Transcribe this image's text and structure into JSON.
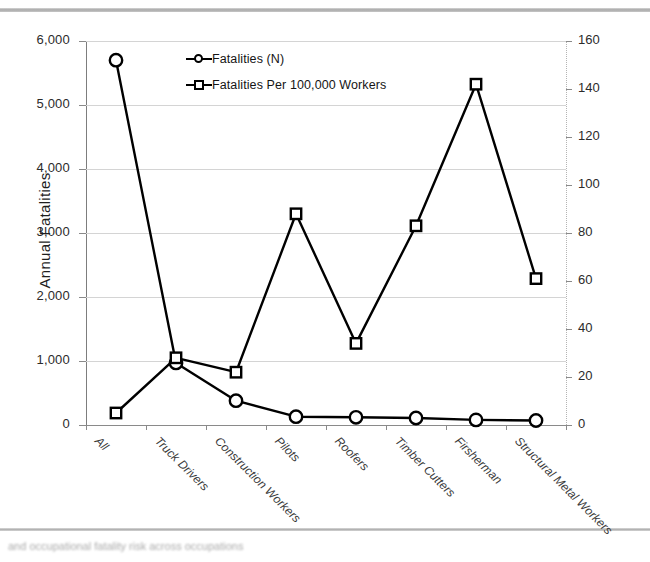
{
  "chart_data": {
    "type": "line",
    "title": "",
    "categories": [
      "All",
      "Truck Drivers",
      "Construction Workers",
      "Pilots",
      "Roofers",
      "Timber Cutters",
      "Firsherman",
      "Structural Metal Workers"
    ],
    "series": [
      {
        "name": "Fatalities (N)",
        "marker": "circle",
        "axis": "left",
        "values": [
          5700,
          970,
          380,
          130,
          120,
          110,
          80,
          70
        ]
      },
      {
        "name": "Fatalities Per 100,000 Workers",
        "marker": "square",
        "axis": "right",
        "values": [
          5,
          28,
          22,
          88,
          34,
          83,
          142,
          61
        ]
      }
    ],
    "xlabel": "",
    "ylabel": "Annual Fatalities",
    "y2label": "Fatality Incidence (Fatalities Per 100,000 Workers)",
    "ylim": [
      0,
      6000
    ],
    "y2lim": [
      0,
      160
    ],
    "yticks": [
      "0",
      "1,000",
      "2,000",
      "3,000",
      "4,000",
      "5,000",
      "6,000"
    ],
    "ytick_values": [
      0,
      1000,
      2000,
      3000,
      4000,
      5000,
      6000
    ],
    "y2ticks": [
      "0",
      "20",
      "40",
      "60",
      "80",
      "100",
      "120",
      "140",
      "160"
    ],
    "y2tick_values": [
      0,
      20,
      40,
      60,
      80,
      100,
      120,
      140,
      160
    ],
    "grid": true,
    "legend_position": "top-center",
    "line_color": "#000000",
    "grid_color": "#d4d4d4"
  },
  "axes": {
    "left_title": "Annual Fatalities",
    "right_title": "Fatality Incidence (Fatalities Per 100,000 Workers)"
  },
  "legend": {
    "items": [
      {
        "label": "Fatalities (N)",
        "marker": "circle-marker"
      },
      {
        "label": "Fatalities Per 100,000 Workers",
        "marker": "square-marker"
      }
    ]
  },
  "caption": {
    "text": "and occupational fatality risk across occupations"
  }
}
